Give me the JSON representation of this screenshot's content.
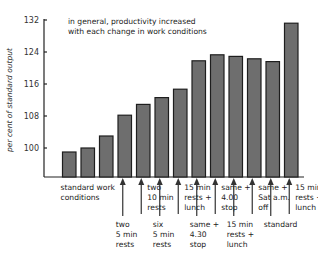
{
  "chart_data": {
    "type": "bar",
    "title": "",
    "annotation": [
      "in general, productivity increased",
      "with each change in work conditions"
    ],
    "xlabel": "",
    "ylabel": "per cent of standard output",
    "ylim": [
      92.75,
      132
    ],
    "yticks": [
      100,
      108,
      116,
      124,
      132
    ],
    "grid": false,
    "legend": "none",
    "values": [
      99,
      100,
      103,
      108.2,
      110.9,
      112.6,
      114.7,
      121.8,
      123.3,
      122.9,
      122.3,
      121.6,
      131.2
    ],
    "category_labels": [
      {
        "bar_index": 0,
        "span_to": 1,
        "position": "upper",
        "arrow": false,
        "lines": [
          "standard work",
          "conditions"
        ]
      },
      {
        "bar_index": 3,
        "position": "lower",
        "arrow": true,
        "lines": [
          "two",
          "5 min",
          "rests"
        ]
      },
      {
        "bar_index": 4,
        "position": "upper",
        "arrow": true,
        "lines": [
          "two",
          "10 min",
          "rests"
        ]
      },
      {
        "bar_index": 5,
        "position": "lower",
        "arrow": true,
        "lines": [
          "six",
          "5 min",
          "rests"
        ]
      },
      {
        "bar_index": 6,
        "position": "upper",
        "arrow": true,
        "lines": [
          "15 min",
          "rests +",
          "lunch"
        ]
      },
      {
        "bar_index": 7,
        "position": "lower",
        "arrow": true,
        "lines": [
          "same +",
          "4.30",
          "stop"
        ]
      },
      {
        "bar_index": 8,
        "position": "upper",
        "arrow": true,
        "lines": [
          "same +",
          "4.00",
          "stop"
        ]
      },
      {
        "bar_index": 9,
        "position": "lower",
        "arrow": true,
        "lines": [
          "15 min",
          "rests +",
          "lunch"
        ]
      },
      {
        "bar_index": 10,
        "position": "upper",
        "arrow": true,
        "lines": [
          "same +",
          "Sat a.m.",
          "off"
        ]
      },
      {
        "bar_index": 11,
        "position": "lower",
        "arrow": true,
        "lines": [
          "standard"
        ]
      },
      {
        "bar_index": 12,
        "position": "upper",
        "arrow": true,
        "lines": [
          "15 min",
          "rests +",
          "lunch"
        ]
      }
    ],
    "colors": {
      "bar_fill": "#6e6e6e",
      "bar_stroke": "#1e1e1e",
      "text": "#222222"
    }
  }
}
